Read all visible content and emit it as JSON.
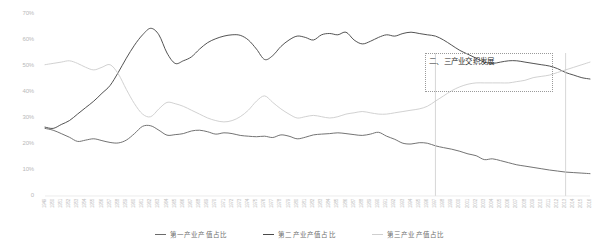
{
  "chart_data": {
    "type": "line",
    "title": "",
    "xlabel": "",
    "ylabel": "",
    "ylim": [
      0,
      70
    ],
    "grid": false,
    "legend_position": "bottom",
    "y_ticks": [
      "0",
      "10%",
      "20%",
      "30%",
      "40%",
      "50%",
      "60%",
      "70%"
    ],
    "y_tick_values": [
      0,
      10,
      20,
      30,
      40,
      50,
      60,
      70
    ],
    "x": [
      1949,
      1950,
      1951,
      1952,
      1953,
      1954,
      1955,
      1956,
      1957,
      1958,
      1959,
      1960,
      1961,
      1962,
      1963,
      1964,
      1965,
      1966,
      1967,
      1968,
      1969,
      1970,
      1971,
      1972,
      1973,
      1974,
      1975,
      1976,
      1977,
      1978,
      1979,
      1980,
      1981,
      1982,
      1983,
      1984,
      1985,
      1986,
      1987,
      1988,
      1989,
      1990,
      1991,
      1992,
      1993,
      1994,
      1995,
      1996,
      1997,
      1998,
      1999,
      2000,
      2001,
      2002,
      2003,
      2004,
      2005,
      2006,
      2007,
      2008,
      2009,
      2010,
      2011,
      2012,
      2013,
      2014,
      2015,
      2016
    ],
    "categories": [
      "1949",
      "1950",
      "1951",
      "1952",
      "1953",
      "1954",
      "1955",
      "1956",
      "1957",
      "1958",
      "1959",
      "1960",
      "1961",
      "1962",
      "1963",
      "1964",
      "1965",
      "1966",
      "1967",
      "1968",
      "1969",
      "1970",
      "1971",
      "1972",
      "1973",
      "1974",
      "1975",
      "1976",
      "1977",
      "1978",
      "1979",
      "1980",
      "1981",
      "1982",
      "1983",
      "1984",
      "1985",
      "1986",
      "1987",
      "1988",
      "1989",
      "1990",
      "1991",
      "1992",
      "1993",
      "1994",
      "1995",
      "1996",
      "1997",
      "1998",
      "1999",
      "2000",
      "2001",
      "2002",
      "2003",
      "2004",
      "2005",
      "2006",
      "2007",
      "2008",
      "2009",
      "2010",
      "2011",
      "2012",
      "2013",
      "2014",
      "2015",
      "2016"
    ],
    "series": [
      {
        "name": "第一产业产值占比",
        "color": "#6b6b6b",
        "values": [
          26.0,
          25.3,
          24.0,
          22.6,
          21.0,
          21.5,
          22.0,
          21.3,
          20.6,
          20.4,
          21.5,
          24.0,
          26.8,
          27.0,
          25.3,
          23.4,
          23.6,
          24.0,
          25.0,
          25.3,
          24.7,
          23.8,
          24.3,
          24.0,
          23.3,
          23.0,
          22.8,
          23.0,
          22.5,
          23.5,
          23.0,
          22.0,
          22.6,
          23.5,
          23.8,
          24.0,
          24.3,
          24.0,
          23.6,
          23.3,
          23.8,
          24.5,
          23.0,
          21.8,
          20.3,
          20.0,
          20.5,
          20.3,
          19.3,
          18.6,
          18.0,
          17.2,
          16.2,
          15.5,
          14.0,
          14.3,
          13.6,
          12.8,
          12.0,
          11.5,
          11.0,
          10.5,
          10.0,
          9.6,
          9.2,
          9.0,
          8.8,
          8.6
        ],
        "units": "%"
      },
      {
        "name": "第二产业产值占比",
        "color": "#4a4a4a",
        "values": [
          26.5,
          26.0,
          27.5,
          29.0,
          31.5,
          34.0,
          36.5,
          39.5,
          42.5,
          47.5,
          53.0,
          58.0,
          62.0,
          64.5,
          62.0,
          55.0,
          51.0,
          52.0,
          53.5,
          56.5,
          59.0,
          60.5,
          61.5,
          62.0,
          61.8,
          60.0,
          56.5,
          52.5,
          54.0,
          57.5,
          60.0,
          61.5,
          61.0,
          60.0,
          62.0,
          62.5,
          62.0,
          63.0,
          60.0,
          58.5,
          59.5,
          61.0,
          62.0,
          61.5,
          62.5,
          63.0,
          62.5,
          62.0,
          61.5,
          60.0,
          58.0,
          56.0,
          54.5,
          53.0,
          51.5,
          51.0,
          51.5,
          52.0,
          52.0,
          51.5,
          51.0,
          50.5,
          50.0,
          49.0,
          47.5,
          46.5,
          45.5,
          45.0
        ],
        "units": "%"
      },
      {
        "name": "第三产业产值占比",
        "color": "#cfcfcf",
        "values": [
          50.5,
          51.0,
          51.5,
          52.0,
          51.0,
          49.5,
          48.5,
          49.5,
          50.5,
          47.0,
          41.0,
          35.5,
          31.5,
          30.5,
          33.5,
          36.0,
          35.5,
          34.5,
          33.0,
          31.5,
          30.0,
          29.0,
          28.5,
          29.0,
          30.5,
          33.0,
          36.5,
          38.5,
          36.0,
          33.5,
          31.5,
          30.0,
          30.5,
          31.0,
          30.5,
          30.0,
          30.5,
          31.5,
          32.0,
          32.5,
          32.0,
          31.5,
          31.5,
          32.0,
          32.5,
          33.0,
          33.5,
          34.5,
          36.5,
          38.5,
          40.5,
          42.0,
          43.0,
          43.5,
          43.5,
          43.5,
          43.5,
          43.5,
          44.0,
          44.5,
          45.5,
          46.0,
          46.5,
          47.5,
          48.5,
          49.5,
          50.5,
          51.5
        ],
        "units": "%"
      }
    ],
    "annotations": [
      {
        "text": "二、三产业交织发展",
        "type": "callout-box",
        "x_start": 1997,
        "x_end": 2013
      }
    ]
  },
  "legend": {
    "items": [
      {
        "label": "第一产业产值占比",
        "color": "#6b6b6b"
      },
      {
        "label": "第二产业产值占比",
        "color": "#4a4a4a"
      },
      {
        "label": "第三产业产值占比",
        "color": "#cfcfcf"
      }
    ]
  }
}
